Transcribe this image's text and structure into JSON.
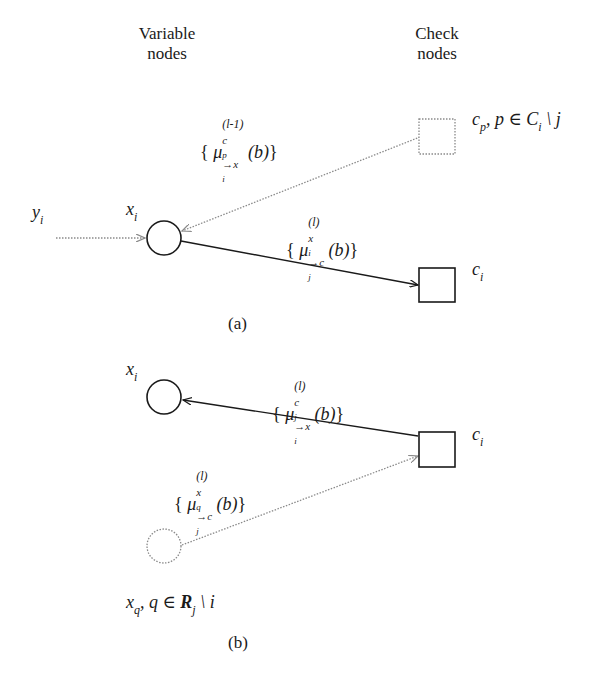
{
  "headers": {
    "variable_line1": "Variable",
    "variable_line2": "nodes",
    "check_line1": "Check",
    "check_line2": "nodes"
  },
  "panel_a": {
    "caption": "(a)",
    "input_label": "y",
    "input_label_sub": "i",
    "var_node_label": "x",
    "var_node_sub": "i",
    "other_check_label": "c",
    "other_check_sub": "p",
    "other_check_set": ", p ∈ C",
    "other_check_set_sub": "i",
    "other_check_excl": " \\ j",
    "check_label": "c",
    "check_sub": "i",
    "msg_in": {
      "open": "{",
      "mu": "μ",
      "sup": "(l-1)",
      "sub": "c",
      "sub_sub": "p",
      "arrow": "→x",
      "arrow_sub": "i",
      "arg": "(b)",
      "close": "}"
    },
    "msg_out": {
      "open": "{",
      "mu": "μ",
      "sup": "(l)",
      "sub": "x",
      "sub_sub": "i",
      "arrow": "→c",
      "arrow_sub": "j",
      "arg": "(b)",
      "close": "}"
    }
  },
  "panel_b": {
    "caption": "(b)",
    "var_node_label": "x",
    "var_node_sub": "i",
    "check_label": "c",
    "check_sub": "i",
    "other_var_label": "x",
    "other_var_sub": "q",
    "other_var_set": ", q ∈ ",
    "other_var_setname": "R",
    "other_var_set_sub": "j",
    "other_var_excl": " \\ i",
    "msg_out": {
      "open": "{",
      "mu": "μ",
      "sup": "(l)",
      "sub": "c",
      "sub_sub": "j",
      "arrow": "→x",
      "arrow_sub": "i",
      "arg": "(b)",
      "close": "}"
    },
    "msg_in": {
      "open": "{",
      "mu": "μ",
      "sup": "(l)",
      "sub": "x",
      "sub_sub": "q",
      "arrow": "→c",
      "arrow_sub": "j",
      "arg": "(b)",
      "close": "}"
    }
  },
  "colors": {
    "solid": "#1a1a1a",
    "dotted": "#8a8a8a"
  }
}
